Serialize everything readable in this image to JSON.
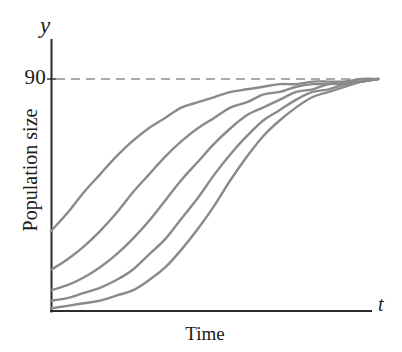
{
  "chart_data": {
    "type": "line",
    "title": "",
    "subtitle": "",
    "xlabel": "Time",
    "ylabel": "Population size",
    "x_axis_variable": "t",
    "y_axis_variable": "y",
    "grid": false,
    "legend_position": "none",
    "xlim": [
      0,
      100
    ],
    "ylim": [
      0,
      100
    ],
    "xticks": [],
    "yticks": [
      90
    ],
    "ytick_labels": [
      "90"
    ],
    "annotations": [
      {
        "name": "carrying-capacity-asymptote",
        "kind": "horizontal-dashed-line",
        "value": 90,
        "label": "90",
        "style": "dashed",
        "color": "#a8a8a8"
      }
    ],
    "series_color": "#8a8a8a",
    "series_note": "Five logistic growth curves with different initial population sizes, all converging to the carrying capacity of 90.",
    "series": [
      {
        "name": "curve-1",
        "initial_value": 31,
        "asymptote": 90,
        "points": [
          [
            0,
            31
          ],
          [
            5,
            38
          ],
          [
            10,
            46
          ],
          [
            15,
            53
          ],
          [
            20,
            60
          ],
          [
            25,
            66
          ],
          [
            30,
            71
          ],
          [
            35,
            75
          ],
          [
            40,
            79
          ],
          [
            45,
            81
          ],
          [
            50,
            83
          ],
          [
            55,
            85
          ],
          [
            60,
            86
          ],
          [
            65,
            87
          ],
          [
            70,
            88
          ],
          [
            75,
            88
          ],
          [
            80,
            89
          ],
          [
            85,
            89
          ],
          [
            90,
            89
          ],
          [
            95,
            90
          ],
          [
            100,
            90
          ]
        ]
      },
      {
        "name": "curve-2",
        "initial_value": 16,
        "asymptote": 90,
        "points": [
          [
            0,
            16
          ],
          [
            5,
            20
          ],
          [
            10,
            25
          ],
          [
            15,
            31
          ],
          [
            20,
            38
          ],
          [
            25,
            46
          ],
          [
            30,
            53
          ],
          [
            35,
            60
          ],
          [
            40,
            66
          ],
          [
            45,
            71
          ],
          [
            50,
            75
          ],
          [
            55,
            79
          ],
          [
            60,
            81
          ],
          [
            65,
            84
          ],
          [
            70,
            85
          ],
          [
            75,
            87
          ],
          [
            80,
            88
          ],
          [
            85,
            88
          ],
          [
            90,
            89
          ],
          [
            95,
            89
          ],
          [
            100,
            90
          ]
        ]
      },
      {
        "name": "curve-3",
        "initial_value": 8,
        "asymptote": 90,
        "points": [
          [
            0,
            8
          ],
          [
            5,
            10
          ],
          [
            10,
            13
          ],
          [
            15,
            17
          ],
          [
            20,
            22
          ],
          [
            25,
            28
          ],
          [
            30,
            35
          ],
          [
            35,
            43
          ],
          [
            40,
            51
          ],
          [
            45,
            58
          ],
          [
            50,
            65
          ],
          [
            55,
            71
          ],
          [
            60,
            76
          ],
          [
            65,
            79
          ],
          [
            70,
            82
          ],
          [
            75,
            85
          ],
          [
            80,
            86
          ],
          [
            85,
            88
          ],
          [
            90,
            88
          ],
          [
            95,
            89
          ],
          [
            100,
            90
          ]
        ]
      },
      {
        "name": "curve-4",
        "initial_value": 4,
        "asymptote": 90,
        "points": [
          [
            0,
            4
          ],
          [
            5,
            5
          ],
          [
            10,
            7
          ],
          [
            15,
            9
          ],
          [
            20,
            12
          ],
          [
            25,
            16
          ],
          [
            30,
            22
          ],
          [
            35,
            28
          ],
          [
            40,
            36
          ],
          [
            45,
            44
          ],
          [
            50,
            53
          ],
          [
            55,
            61
          ],
          [
            60,
            68
          ],
          [
            65,
            74
          ],
          [
            70,
            78
          ],
          [
            75,
            82
          ],
          [
            80,
            85
          ],
          [
            85,
            86
          ],
          [
            90,
            88
          ],
          [
            95,
            89
          ],
          [
            100,
            90
          ]
        ]
      },
      {
        "name": "curve-5",
        "initial_value": 1,
        "asymptote": 90,
        "points": [
          [
            0,
            1
          ],
          [
            5,
            2
          ],
          [
            10,
            3
          ],
          [
            15,
            4
          ],
          [
            20,
            6
          ],
          [
            25,
            8
          ],
          [
            30,
            12
          ],
          [
            35,
            17
          ],
          [
            40,
            24
          ],
          [
            45,
            32
          ],
          [
            50,
            41
          ],
          [
            55,
            51
          ],
          [
            60,
            60
          ],
          [
            65,
            68
          ],
          [
            70,
            74
          ],
          [
            75,
            79
          ],
          [
            80,
            83
          ],
          [
            85,
            85
          ],
          [
            90,
            87
          ],
          [
            95,
            89
          ],
          [
            100,
            90
          ]
        ]
      }
    ]
  },
  "axes": {
    "y_variable_label": "y",
    "x_variable_label": "t",
    "y_title": "Population size",
    "x_title": "Time",
    "y_tick_90": "90"
  },
  "colors": {
    "curve": "#8a8a8a",
    "axis": "#2b2b2b",
    "dashed_line": "#aaaaaa",
    "text": "#1a1a1a",
    "background": "#ffffff"
  }
}
